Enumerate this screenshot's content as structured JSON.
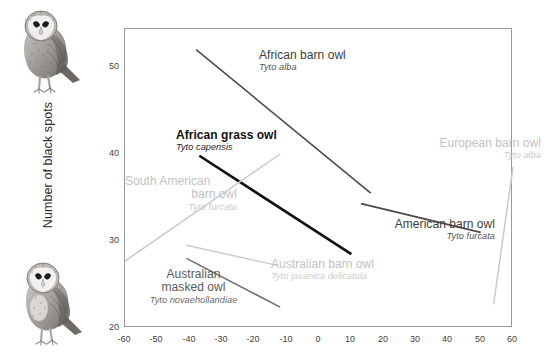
{
  "chart_data": {
    "type": "line",
    "title": "",
    "xlabel": "",
    "ylabel": "Number of black spots",
    "xlim": [
      -60,
      60
    ],
    "ylim": [
      20,
      55
    ],
    "xticks": [
      "-60",
      "-50",
      "-40",
      "-30",
      "-20",
      "-10",
      "0",
      "10",
      "20",
      "30",
      "40",
      "50",
      "60"
    ],
    "yticks": [
      "50",
      "40",
      "30",
      "20"
    ],
    "grid": false,
    "legend": "inline-annotations",
    "series": [
      {
        "name": "African barn owl",
        "latin": "Tyto alba",
        "color": "#4a4a4a",
        "width": 1.6,
        "tone": "dark",
        "points": [
          [
            -38,
            52.0
          ],
          [
            16,
            35.5
          ]
        ]
      },
      {
        "name": "African grass owl",
        "latin": "Tyto capensis",
        "color": "#111111",
        "width": 2.6,
        "tone": "black",
        "points": [
          [
            -37,
            39.8
          ],
          [
            10,
            28.5
          ]
        ]
      },
      {
        "name": "South American barn owl",
        "latin": "Tyto furcata",
        "color": "#c9c9c9",
        "width": 1.5,
        "tone": "light",
        "points": [
          [
            -60,
            27.7
          ],
          [
            -12,
            40.0
          ]
        ]
      },
      {
        "name": "European barn owl",
        "latin": "Tyto alba",
        "color": "#c9c9c9",
        "width": 1.5,
        "tone": "light",
        "points": [
          [
            54,
            22.7
          ],
          [
            60,
            38.5
          ]
        ]
      },
      {
        "name": "American barn owl",
        "latin": "Tyto furcata",
        "color": "#4a4a4a",
        "width": 1.8,
        "tone": "dark",
        "points": [
          [
            13,
            34.3
          ],
          [
            50,
            31.0
          ]
        ]
      },
      {
        "name": "Australian barn owl",
        "latin": "Tyto javanica delicatula",
        "color": "#cccccc",
        "width": 1.5,
        "tone": "light",
        "points": [
          [
            -41,
            29.5
          ],
          [
            -13,
            27.2
          ]
        ]
      },
      {
        "name": "Australian masked owl",
        "latin": "Tyto novaehollandiae",
        "color": "#6f6f6f",
        "width": 1.6,
        "tone": "mid",
        "points": [
          [
            -41,
            28.0
          ],
          [
            -12,
            22.4
          ]
        ]
      }
    ]
  },
  "axis": {
    "y_title": "Number of black spots",
    "y_ticks": [
      {
        "label": "50",
        "top": 61
      },
      {
        "label": "40",
        "top": 148
      },
      {
        "label": "30",
        "top": 235
      },
      {
        "label": "20",
        "top": 322
      }
    ],
    "x_ticks": [
      {
        "label": "-60",
        "left": 112
      },
      {
        "label": "-50",
        "left": 144
      },
      {
        "label": "-40",
        "left": 177
      },
      {
        "label": "-30",
        "left": 209
      },
      {
        "label": "-20",
        "left": 241
      },
      {
        "label": "-10",
        "left": 274
      },
      {
        "label": "0",
        "left": 306
      },
      {
        "label": "10",
        "left": 338
      },
      {
        "label": "20",
        "left": 371
      },
      {
        "label": "30",
        "left": 403
      },
      {
        "label": "40",
        "left": 435
      },
      {
        "label": "50",
        "left": 468
      },
      {
        "label": "60",
        "left": 500
      }
    ]
  },
  "annotations": [
    {
      "key": "african-barn-owl",
      "name": "African barn owl",
      "latin": "Tyto alba",
      "tone": "tone-dark",
      "align": "al-left",
      "left": 259,
      "top": 49
    },
    {
      "key": "african-grass-owl",
      "name": "African grass owl",
      "latin": "Tyto capensis",
      "tone": "tone-black",
      "align": "al-left",
      "left": 176,
      "top": 129
    },
    {
      "key": "south-american-barn-owl",
      "name": "South American",
      "name2": "barn owl",
      "latin": "Tyto furcata",
      "tone": "tone-light",
      "align": "al-left",
      "left": 125,
      "top": 175
    },
    {
      "key": "european-barn-owl",
      "name": "European barn owl",
      "latin": "Tyto alba",
      "tone": "tone-light",
      "align": "al-right",
      "left": 396,
      "top": 137
    },
    {
      "key": "american-barn-owl",
      "name": "American barn owl",
      "latin": "Tyto furcata",
      "tone": "tone-dark",
      "align": "al-right",
      "left": 350,
      "top": 218
    },
    {
      "key": "australian-barn-owl",
      "name": "Australian barn owl",
      "latin": "Tyto javanica delicatula",
      "tone": "tone-light",
      "align": "al-left",
      "left": 271,
      "top": 258
    },
    {
      "key": "australian-masked-owl",
      "name": "Australian",
      "name2": "masked owl",
      "latin": "Tyto novaehollandiae",
      "tone": "tone-mid",
      "align": "al-center",
      "left": 126,
      "top": 268
    }
  ],
  "illustrations": [
    {
      "key": "owl-top",
      "name": "barn-owl-illustration-top"
    },
    {
      "key": "owl-bottom",
      "name": "barn-owl-illustration-bottom"
    }
  ]
}
